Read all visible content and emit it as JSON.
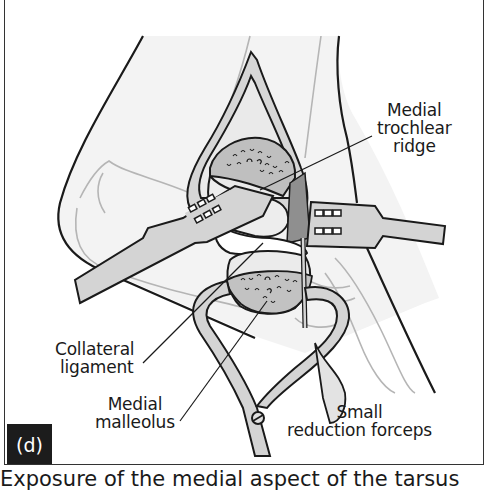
{
  "figure": {
    "panel_label": "(d)",
    "labels": {
      "medial_trochlear_ridge": [
        "Medial",
        "trochlear",
        "ridge"
      ],
      "collateral_ligament": [
        "Collateral",
        "ligament"
      ],
      "medial_malleolus": [
        "Medial",
        "malleolus"
      ],
      "small_reduction_forceps": [
        "Small",
        "reduction forceps"
      ]
    },
    "colors": {
      "outline": "#1a1a1a",
      "skin_fill": "#f2f2f2",
      "retractor_fill": "#d4d4d4",
      "bone_fill": "#ebebeb",
      "cancellous_fill": "#bdbdbd",
      "dark_tissue": "#8a8a8a",
      "badge_bg": "#1c1c1c"
    }
  },
  "caption": {
    "text": "Exposure of the medial aspect of the tarsus"
  }
}
